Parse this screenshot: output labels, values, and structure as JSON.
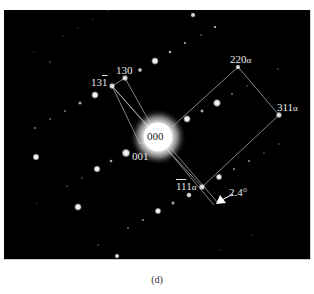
{
  "figure": {
    "panel_caption": "(d)",
    "background_color": "#000000",
    "spot_color": "#ffffff",
    "line_color": "#bdbdbd",
    "labels": {
      "center": "000",
      "l130": "130",
      "l131bar_base": "13",
      "l131bar_over": "1",
      "l001": "001",
      "l220a_num": "220",
      "l220a_sub": "α",
      "l311a_num": "311",
      "l311a_sub": "α",
      "l111a_over": "11",
      "l111a_tail": "1",
      "l111a_sub": "α",
      "angle": "2.4°"
    },
    "spots": [
      {
        "name": "000",
        "x": 158,
        "y": 137,
        "r": 15,
        "brightness": 1.0
      },
      {
        "name": "130",
        "x": 125,
        "y": 78,
        "r": 2.5,
        "brightness": 0.9
      },
      {
        "name": "13-1",
        "x": 112,
        "y": 86,
        "r": 2.5,
        "brightness": 0.9
      },
      {
        "name": "220a",
        "x": 238,
        "y": 67,
        "r": 2,
        "brightness": 0.9
      },
      {
        "name": "311a",
        "x": 279,
        "y": 115,
        "r": 2.5,
        "brightness": 0.9
      },
      {
        "name": "-1-11a",
        "x": 202,
        "y": 187,
        "r": 2.5,
        "brightness": 0.9
      },
      {
        "name": "001",
        "x": 126,
        "y": 153,
        "r": 3.5,
        "brightness": 1.0
      },
      {
        "name": "s",
        "x": 193,
        "y": 15,
        "r": 2,
        "brightness": 0.9
      },
      {
        "name": "s",
        "x": 215,
        "y": 27,
        "r": 1.2,
        "brightness": 0.7
      },
      {
        "name": "s",
        "x": 201,
        "y": 35,
        "r": 0.8,
        "brightness": 0.5
      },
      {
        "name": "s",
        "x": 185,
        "y": 43,
        "r": 1.2,
        "brightness": 0.6
      },
      {
        "name": "s",
        "x": 170,
        "y": 52,
        "r": 1.4,
        "brightness": 0.7
      },
      {
        "name": "s",
        "x": 155,
        "y": 61,
        "r": 3,
        "brightness": 1.0
      },
      {
        "name": "s",
        "x": 140,
        "y": 70,
        "r": 1.8,
        "brightness": 0.8
      },
      {
        "name": "s",
        "x": 217,
        "y": 103,
        "r": 3.2,
        "brightness": 1.0
      },
      {
        "name": "s",
        "x": 202,
        "y": 111,
        "r": 1.5,
        "brightness": 0.7
      },
      {
        "name": "s",
        "x": 187,
        "y": 119,
        "r": 3,
        "brightness": 1.0
      },
      {
        "name": "s",
        "x": 232,
        "y": 94,
        "r": 0.9,
        "brightness": 0.5
      },
      {
        "name": "s",
        "x": 247,
        "y": 86,
        "r": 0.8,
        "brightness": 0.4
      },
      {
        "name": "s",
        "x": 278,
        "y": 69,
        "r": 0.8,
        "brightness": 0.4
      },
      {
        "name": "s",
        "x": 95,
        "y": 95,
        "r": 3,
        "brightness": 1.0
      },
      {
        "name": "s",
        "x": 80,
        "y": 103,
        "r": 1.5,
        "brightness": 0.7
      },
      {
        "name": "s",
        "x": 65,
        "y": 111,
        "r": 0.9,
        "brightness": 0.5
      },
      {
        "name": "s",
        "x": 50,
        "y": 119,
        "r": 0.9,
        "brightness": 0.4
      },
      {
        "name": "s",
        "x": 35,
        "y": 128,
        "r": 0.9,
        "brightness": 0.5
      },
      {
        "name": "s",
        "x": 36,
        "y": 157,
        "r": 2.8,
        "brightness": 1.0
      },
      {
        "name": "s",
        "x": 111,
        "y": 161,
        "r": 1.4,
        "brightness": 0.7
      },
      {
        "name": "s",
        "x": 97,
        "y": 169,
        "r": 2.8,
        "brightness": 1.0
      },
      {
        "name": "s",
        "x": 82,
        "y": 178,
        "r": 0.8,
        "brightness": 0.4
      },
      {
        "name": "s",
        "x": 67,
        "y": 186,
        "r": 0.8,
        "brightness": 0.4
      },
      {
        "name": "s",
        "x": 78,
        "y": 207,
        "r": 3,
        "brightness": 1.0
      },
      {
        "name": "s",
        "x": 219,
        "y": 177,
        "r": 2.6,
        "brightness": 1.0
      },
      {
        "name": "s",
        "x": 234,
        "y": 169,
        "r": 1,
        "brightness": 0.5
      },
      {
        "name": "s",
        "x": 249,
        "y": 161,
        "r": 1,
        "brightness": 0.5
      },
      {
        "name": "s",
        "x": 264,
        "y": 153,
        "r": 0.8,
        "brightness": 0.4
      },
      {
        "name": "s",
        "x": 279,
        "y": 144,
        "r": 0.8,
        "brightness": 0.4
      },
      {
        "name": "s",
        "x": 189,
        "y": 195,
        "r": 2.2,
        "brightness": 0.9
      },
      {
        "name": "s",
        "x": 173,
        "y": 203,
        "r": 1.5,
        "brightness": 0.7
      },
      {
        "name": "s",
        "x": 158,
        "y": 211,
        "r": 2.6,
        "brightness": 1.0
      },
      {
        "name": "s",
        "x": 143,
        "y": 220,
        "r": 1,
        "brightness": 0.5
      },
      {
        "name": "s",
        "x": 128,
        "y": 228,
        "r": 0.9,
        "brightness": 0.4
      },
      {
        "name": "s",
        "x": 117,
        "y": 256,
        "r": 2,
        "brightness": 0.9
      },
      {
        "name": "s",
        "x": 98,
        "y": 245,
        "r": 0.8,
        "brightness": 0.4
      },
      {
        "name": "s",
        "x": 50,
        "y": 62,
        "r": 0.8,
        "brightness": 0.4
      },
      {
        "name": "s",
        "x": 34,
        "y": 52,
        "r": 0.7,
        "brightness": 0.3
      },
      {
        "name": "s",
        "x": 63,
        "y": 36,
        "r": 0.7,
        "brightness": 0.3
      },
      {
        "name": "s",
        "x": 78,
        "y": 28,
        "r": 0.7,
        "brightness": 0.3
      },
      {
        "name": "s",
        "x": 93,
        "y": 19,
        "r": 0.7,
        "brightness": 0.3
      },
      {
        "name": "s",
        "x": 108,
        "y": 11,
        "r": 0.7,
        "brightness": 0.3
      },
      {
        "name": "s",
        "x": 37,
        "y": 203,
        "r": 0.7,
        "brightness": 0.3
      },
      {
        "name": "s",
        "x": 220,
        "y": 250,
        "r": 0.7,
        "brightness": 0.3
      },
      {
        "name": "s",
        "x": 252,
        "y": 235,
        "r": 0.7,
        "brightness": 0.3
      }
    ],
    "lines": [
      {
        "from": [
          112,
          86
        ],
        "to": [
          125,
          78
        ]
      },
      {
        "from": [
          125,
          78
        ],
        "to": [
          158,
          137
        ]
      },
      {
        "from": [
          112,
          86
        ],
        "to": [
          158,
          137
        ]
      },
      {
        "from": [
          112,
          86
        ],
        "to": [
          154,
          134
        ]
      },
      {
        "from": [
          112,
          86
        ],
        "to": [
          140,
          144
        ]
      },
      {
        "from": [
          140,
          144
        ],
        "to": [
          158,
          137
        ]
      },
      {
        "from": [
          172,
          127
        ],
        "to": [
          238,
          67
        ]
      },
      {
        "from": [
          238,
          67
        ],
        "to": [
          279,
          115
        ]
      },
      {
        "from": [
          279,
          115
        ],
        "to": [
          202,
          187
        ]
      },
      {
        "from": [
          166,
          148
        ],
        "to": [
          202,
          187
        ]
      },
      {
        "from": [
          164,
          146
        ],
        "to": [
          214,
          205
        ]
      },
      {
        "from": [
          168,
          145
        ],
        "to": [
          218,
          203
        ]
      }
    ],
    "arrow": {
      "tail": [
        233,
        194
      ],
      "tip": [
        216,
        204
      ]
    }
  }
}
